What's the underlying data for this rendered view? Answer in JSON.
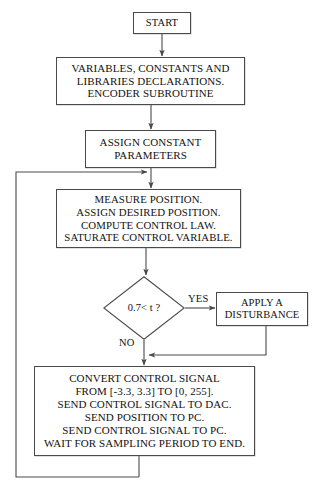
{
  "diagram": {
    "type": "flowchart",
    "background_color": "#ffffff",
    "line_color": "#4a4a4a",
    "text_color": "#121212"
  },
  "nodes": {
    "start": {
      "shape": "process",
      "label": "START"
    },
    "declarations": {
      "shape": "process",
      "label": "VARIABLES, CONSTANTS AND\nLIBRARIES  DECLARATIONS.\nENCODER SUBROUTINE"
    },
    "assign_constants": {
      "shape": "process",
      "label": "ASSIGN CONSTANT\nPARAMETERS"
    },
    "measure": {
      "shape": "process",
      "label": "MEASURE POSITION.\nASSIGN DESIRED POSITION.\nCOMPUTE CONTROL LAW.\nSATURATE CONTROL VARIABLE."
    },
    "decision": {
      "shape": "decision",
      "label": "0.7< t ?"
    },
    "disturbance": {
      "shape": "process",
      "label": "APPLY A\nDISTURBANCE"
    },
    "convert": {
      "shape": "process",
      "label": "CONVERT CONTROL SIGNAL\nFROM [-3.3, 3.3] TO [0, 255].\nSEND CONTROL SIGNAL TO DAC.\nSEND POSITION TO PC.\nSEND CONTROL SIGNAL TO PC.\nWAIT FOR SAMPLING PERIOD TO END."
    }
  },
  "edge_labels": {
    "yes": "YES",
    "no": "NO"
  }
}
